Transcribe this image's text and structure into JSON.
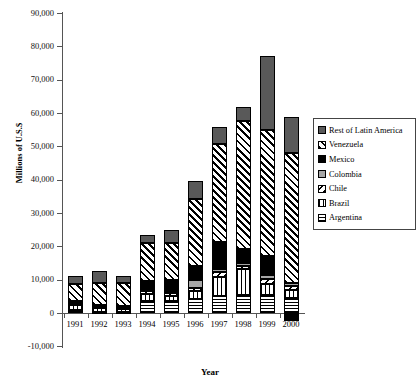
{
  "chart_data": {
    "type": "bar",
    "stacked": true,
    "title": "",
    "xlabel": "Year",
    "ylabel": "Millions of U.S.$",
    "categories": [
      "1991",
      "1992",
      "1993",
      "1994",
      "1995",
      "1996",
      "1997",
      "1998",
      "1999",
      "2000"
    ],
    "ylim": [
      -10000,
      90000
    ],
    "ytick_step": 10000,
    "ytick_labels": [
      "90,000",
      "80,000",
      "70,000",
      "60,000",
      "50,000",
      "40,000",
      "30,000",
      "20,000",
      "10,000",
      "0",
      "-10,000"
    ],
    "ytick_values": [
      90000,
      80000,
      70000,
      60000,
      50000,
      40000,
      30000,
      20000,
      10000,
      0,
      -10000
    ],
    "grid": false,
    "legend_position": "right",
    "series": [
      {
        "name": "Argentina",
        "fill": "horizontal-stripes",
        "values": [
          1000,
          400,
          300,
          3500,
          3700,
          4200,
          5000,
          5500,
          5300,
          4600
        ]
      },
      {
        "name": "Brazil",
        "fill": "vertical-stripes",
        "values": [
          1500,
          1200,
          900,
          2200,
          1500,
          2500,
          5800,
          7700,
          3400,
          2300
        ]
      },
      {
        "name": "Chile",
        "fill": "diagonal-down",
        "values": [
          600,
          400,
          400,
          900,
          900,
          900,
          1500,
          900,
          1600,
          1300
        ]
      },
      {
        "name": "Colombia",
        "fill": "gray",
        "values": [
          200,
          200,
          200,
          500,
          500,
          2200,
          1000,
          1000,
          1200,
          900
        ]
      },
      {
        "name": "Mexico",
        "fill": "black",
        "values": [
          400,
          300,
          300,
          2400,
          3300,
          4200,
          8000,
          4000,
          5500,
          -2300
        ]
      },
      {
        "name": "Venezuela",
        "fill": "diagonal-up",
        "values": [
          5000,
          6600,
          6900,
          11400,
          11000,
          20100,
          29500,
          38600,
          37800,
          38800
        ]
      },
      {
        "name": "Rest of Latin America",
        "fill": "dark-gray",
        "values": [
          2300,
          3400,
          2000,
          2600,
          4000,
          5400,
          5000,
          4200,
          22200,
          10800
        ]
      }
    ],
    "totals": [
      11000,
      12500,
      11000,
      23500,
      24900,
      39500,
      55800,
      61900,
      77000,
      56400
    ]
  },
  "legend": {
    "items": [
      {
        "label": "Rest of Latin America",
        "swatch": "dark-gray-swatch"
      },
      {
        "label": "Venezuela",
        "swatch": "diagonal-up-swatch"
      },
      {
        "label": "Mexico",
        "swatch": "black-swatch"
      },
      {
        "label": "Colombia",
        "swatch": "gray-swatch"
      },
      {
        "label": "Chile",
        "swatch": "diagonal-down-swatch"
      },
      {
        "label": "Brazil",
        "swatch": "vertical-stripes-swatch"
      },
      {
        "label": "Argentina",
        "swatch": "horizontal-stripes-swatch"
      }
    ]
  },
  "colors": {
    "rest_of_latin_america": "#595959",
    "colombia": "#a6a6a6",
    "mexico": "#000000",
    "axis": "#555555",
    "background": "#ffffff"
  }
}
